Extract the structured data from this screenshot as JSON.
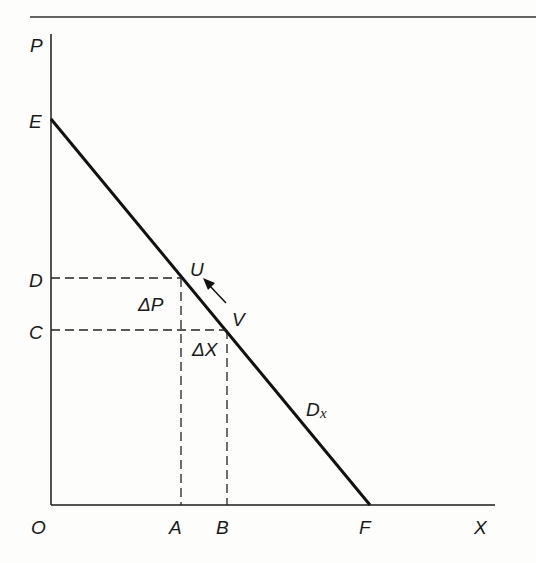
{
  "diagram": {
    "type": "demand-curve",
    "axes": {
      "y_label": "P",
      "x_label": "X",
      "origin_label": "O"
    },
    "y_points": {
      "E": "E",
      "D": "D",
      "C": "C"
    },
    "x_points": {
      "A": "A",
      "B": "B",
      "F": "F"
    },
    "curve": {
      "label": "D",
      "subscript": "x"
    },
    "points": {
      "U": "U",
      "V": "V"
    },
    "deltas": {
      "price": "ΔP",
      "quantity": "ΔX"
    },
    "colors": {
      "ink": "#1a1a1a",
      "background": "#fdfdfb"
    }
  }
}
